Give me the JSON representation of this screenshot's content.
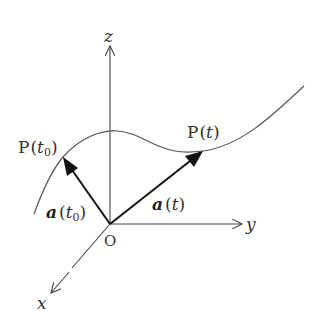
{
  "figure": {
    "colors": {
      "background": "#ffffff",
      "axis": "#444444",
      "curve": "#555555",
      "vector": "#111111",
      "text": "#333333"
    },
    "axes": {
      "origin_label": "O",
      "x_label": "x",
      "y_label": "y",
      "z_label": "z"
    },
    "points": [
      {
        "id": "p_t0",
        "name": "P",
        "param": "t",
        "subscript": "0"
      },
      {
        "id": "p_t",
        "name": "P",
        "param": "t",
        "subscript": ""
      }
    ],
    "vectors": [
      {
        "id": "a_t0",
        "name": "a",
        "param": "t",
        "subscript": "0"
      },
      {
        "id": "a_t",
        "name": "a",
        "param": "t",
        "subscript": ""
      }
    ],
    "punct": {
      "open": "(",
      "close": ")"
    }
  }
}
